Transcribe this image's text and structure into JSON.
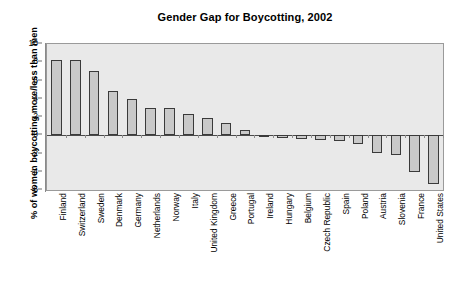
{
  "chart_data": {
    "type": "bar",
    "title": "Gender Gap for Boycotting, 2002",
    "xlabel": "",
    "ylabel": "% of women boycotting more/less than men",
    "ylim": [
      -6,
      10
    ],
    "ytick_values": [
      10,
      8,
      6,
      4,
      2,
      0,
      -2,
      -4,
      -6
    ],
    "ytick_labels": [
      "10",
      "8",
      "6",
      "4",
      "2",
      "0",
      "-2",
      "-4",
      "-6"
    ],
    "grid": false,
    "legend": null,
    "orientation": "vertical",
    "bar_color": "#c9c9c9",
    "bar_edge_color": "#3a3a3a",
    "plot_background": "#e9e9e9",
    "categories": [
      "Finland",
      "Switzerland",
      "Sweden",
      "Denmark",
      "Germany",
      "Netherlands",
      "Norway",
      "Italy",
      "United Kingdom",
      "Greece",
      "Portugal",
      "Ireland",
      "Hungary",
      "Belgium",
      "Czech Republic",
      "Spain",
      "Poland",
      "Austria",
      "Slovenia",
      "France",
      "United States"
    ],
    "values": [
      8.3,
      8.2,
      7.0,
      4.8,
      4.0,
      3.0,
      3.0,
      2.3,
      1.9,
      1.3,
      0.6,
      -0.2,
      -0.3,
      -0.4,
      -0.5,
      -0.6,
      -1.0,
      -1.9,
      -2.2,
      -4.0,
      -5.3
    ]
  }
}
